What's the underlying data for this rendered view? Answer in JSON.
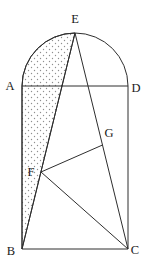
{
  "figure": {
    "name": "norman-window-geometry-diagram",
    "background": "#ffffff",
    "stroke_color": "#2e2e2e",
    "stroke_width": 1,
    "stipple_dot_color": "#8f8f8f",
    "label_color": "#1a1a1a",
    "arc_radius": 53,
    "points": {
      "E": {
        "x": 75,
        "y": 33
      },
      "A": {
        "x": 22,
        "y": 86
      },
      "D": {
        "x": 128,
        "y": 86
      },
      "B": {
        "x": 22,
        "y": 249
      },
      "C": {
        "x": 128,
        "y": 249
      },
      "F": {
        "x": 41,
        "y": 172
      },
      "G": {
        "x": 102.5,
        "y": 145
      }
    },
    "outline_path": "M 22 249 L 22 86 A 53 53 0 0 1 128 86 L 128 249 Z",
    "shaded_region_path": "M 75 33 A 53 53 0 0 0 22 86 L 22 249 Z",
    "segments": [
      {
        "name": "segment-A-D",
        "from": "A",
        "to": "D"
      },
      {
        "name": "segment-E-B",
        "from": "E",
        "to": "B"
      },
      {
        "name": "segment-E-C",
        "from": "E",
        "to": "C"
      },
      {
        "name": "segment-F-G",
        "from": "F",
        "to": "G"
      },
      {
        "name": "segment-F-C",
        "from": "F",
        "to": "C"
      }
    ],
    "labels": [
      {
        "name": "label-E",
        "text": "E",
        "x": 75,
        "y": 23
      },
      {
        "name": "label-A",
        "text": "A",
        "x": 10,
        "y": 90
      },
      {
        "name": "label-D",
        "text": "D",
        "x": 136,
        "y": 92
      },
      {
        "name": "label-G",
        "text": "G",
        "x": 109,
        "y": 137
      },
      {
        "name": "label-F",
        "text": "F",
        "x": 31,
        "y": 176
      },
      {
        "name": "label-B",
        "text": "B",
        "x": 11,
        "y": 255
      },
      {
        "name": "label-C",
        "text": "C",
        "x": 135,
        "y": 254
      }
    ]
  }
}
